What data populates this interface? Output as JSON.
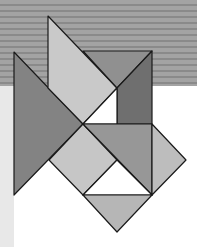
{
  "figure": {
    "title": "",
    "background": {
      "stripe_colors": [
        "#a3a3a3",
        "#8a8a8a"
      ],
      "stripe_height": 86,
      "left_strip_color": "#e8e8e8",
      "base_color": "#ffffff"
    },
    "stroke": "#1a1a1a",
    "shapes": [
      {
        "name": "large-left-triangle",
        "points": "14,52 83,124 14,195",
        "fill": "#838383"
      },
      {
        "name": "light-parallelogram",
        "points": "48,16 117,88 83,124 48,88",
        "fill": "#c9c9c9"
      },
      {
        "name": "top-triangle",
        "points": "83,51 152,51 117,88",
        "fill": "#909090"
      },
      {
        "name": "dark-right-quad",
        "points": "117,88 152,51 152,124 117,124",
        "fill": "#6f6f6f"
      },
      {
        "name": "white-small-triangle",
        "points": "83,124 117,88 117,124",
        "fill": "#ffffff"
      },
      {
        "name": "light-left-square",
        "points": "83,124 117,160 83,195 49,160",
        "fill": "#c6c6c6"
      },
      {
        "name": "mid-grey-triangle",
        "points": "83,124 152,124 152,195",
        "fill": "#979797"
      },
      {
        "name": "white-lower-triangle",
        "points": "83,195 117,160 152,195",
        "fill": "#ffffff"
      },
      {
        "name": "right-diamond-triangle",
        "points": "152,124 186,160 152,195",
        "fill": "#bdbdbd"
      },
      {
        "name": "bottom-triangle",
        "points": "83,195 152,195 117,232",
        "fill": "#b6b6b6"
      }
    ]
  }
}
